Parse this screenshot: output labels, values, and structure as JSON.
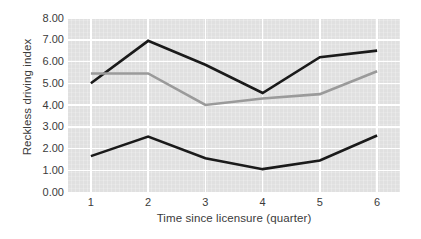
{
  "chart_data": {
    "type": "line",
    "title": "",
    "xlabel": "Time since licensure (quarter)",
    "ylabel": "Reckless driving index",
    "x": [
      1,
      2,
      3,
      4,
      5,
      6
    ],
    "xtick_labels": [
      "1",
      "2",
      "3",
      "4",
      "5",
      "6"
    ],
    "ytick_labels": [
      "0.00",
      "1.00",
      "2.00",
      "3.00",
      "4.00",
      "5.00",
      "6.00",
      "7.00",
      "8.00"
    ],
    "ytick_values": [
      0,
      1,
      2,
      3,
      4,
      5,
      6,
      7,
      8
    ],
    "xlim": [
      0.6,
      6.4
    ],
    "ylim": [
      0,
      8
    ],
    "grid": true,
    "legend": "none",
    "plot_background": "#e0e0e0",
    "series": [
      {
        "name": "upper-dark-line",
        "color": "#1a1a1a",
        "width": 2.6,
        "values": [
          5.0,
          6.95,
          5.85,
          4.55,
          6.2,
          6.5
        ]
      },
      {
        "name": "middle-gray-line",
        "color": "#9a9a9a",
        "width": 2.6,
        "values": [
          5.45,
          5.45,
          4.0,
          4.3,
          4.5,
          5.55
        ]
      },
      {
        "name": "lower-dark-line",
        "color": "#1a1a1a",
        "width": 2.6,
        "values": [
          1.65,
          2.55,
          1.55,
          1.05,
          1.45,
          2.6
        ]
      }
    ]
  }
}
